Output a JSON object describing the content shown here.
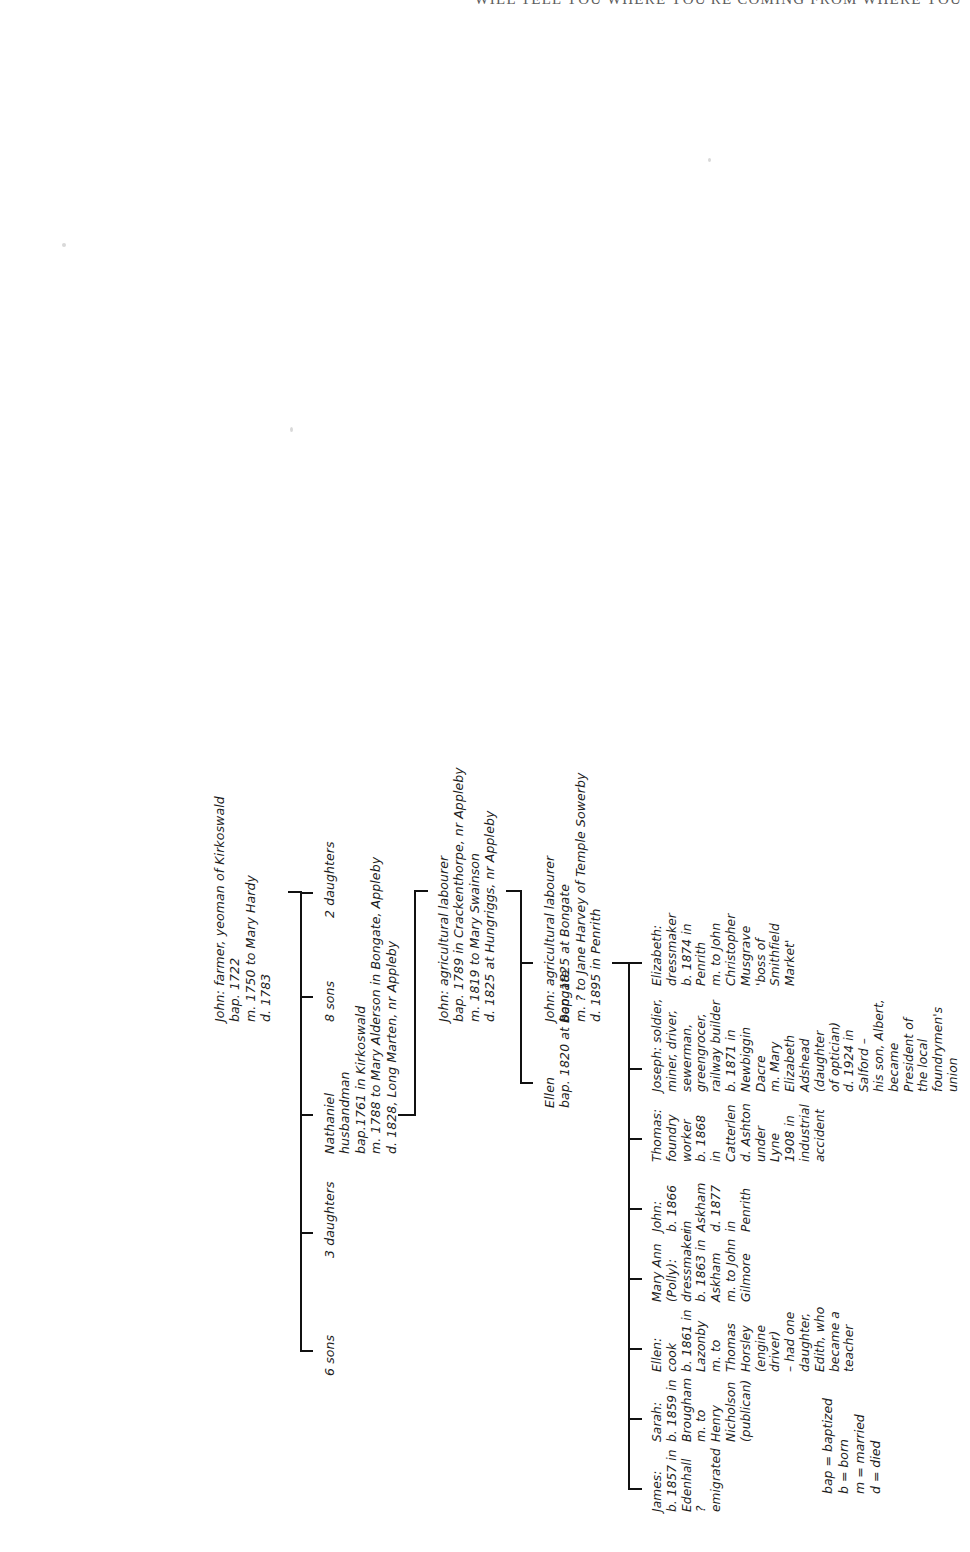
{
  "running_head": "WILL TELL YOU WHERE YOU'RE COMING FROM WHERE YOU",
  "legend": {
    "name": "key-legend",
    "text": "bap = baptized\nb = born\nm = married\nd = died"
  },
  "generations": [
    {
      "id": "gen1",
      "label": "generation-1",
      "nodes": [
        {
          "name": "john-farmer-yeoman",
          "text": "John: farmer, yeoman of Kirkoswald\nbap. 1722\nm. 1750 to Mary Hardy\nd. 1783"
        }
      ]
    },
    {
      "id": "gen2",
      "label": "generation-2",
      "nodes": [
        {
          "name": "six-sons",
          "text": "6 sons"
        },
        {
          "name": "three-daughters",
          "text": "3 daughters"
        },
        {
          "name": "nathaniel",
          "text": "Nathaniel\nhusbandman\nbap.1761 in Kirkoswald\nm. 1788 to Mary Alderson in Bongate, Appleby\nd. 1828, Long Marten, nr Appleby"
        },
        {
          "name": "eight-sons",
          "text": "8 sons"
        },
        {
          "name": "two-daughters",
          "text": "2 daughters"
        }
      ]
    },
    {
      "id": "gen3",
      "label": "generation-3",
      "nodes": [
        {
          "name": "john-ag-labourer-crackenthorpe",
          "text": "John: agricultural labourer\nbap. 1789 in Crackenthorpe, nr Appleby\nm. 1819 to Mary Swainson\nd. 1825 at Hungriggs, nr Appleby"
        }
      ]
    },
    {
      "id": "gen4",
      "label": "generation-4",
      "nodes": [
        {
          "name": "ellen-bongate",
          "text": "Ellen\nbap. 1820 at Bongate"
        },
        {
          "name": "john-ag-labourer-bongate",
          "text": "John: agricultural labourer\nbap. 1825 at Bongate\nm. ? to Jane Harvey of Temple Sowerby\nd. 1895 in Penrith"
        }
      ]
    },
    {
      "id": "gen5",
      "label": "generation-5-children",
      "nodes": [
        {
          "name": "child-james",
          "text": "James:\nb. 1857 in\nEdenhall\n? emigrated"
        },
        {
          "name": "child-sarah",
          "text": "Sarah:\nb. 1859 in\nBrougham\nm. to Henry\nNicholson\n(publican)"
        },
        {
          "name": "child-ellen",
          "text": "Ellen: cook\nb. 1861 in\nLazonby\nm. to Thomas\nHorsley\n(engine driver)\n– had one\ndaughter,\nEdith, who\nbecame a\nteacher"
        },
        {
          "name": "child-mary-ann",
          "text": "Mary Ann\n(Polly):\ndressmaker\nb. 1863 in\nAskham\nm. to John\nGilmore"
        },
        {
          "name": "child-john",
          "text": "John:\nb. 1866 in\nAskham\nd. 1877 in\nPenrith"
        },
        {
          "name": "child-thomas",
          "text": "Thomas:\nfoundry\nworker\nb. 1868 in\nCatterlen\nd. Ashton\nunder Lyne\n1908 in\nindustrial\naccident"
        },
        {
          "name": "child-joseph",
          "text": "Joseph: soldier,\nminer, driver,\nsewerman,\ngreengrocer,\nrailway builder\nb. 1871 in Newbiggin\nDacre\nm. Mary Elizabeth\nAdshead (daughter\nof optician)\nd. 1924 in Salford –\nhis son, Albert,\nbecame President of\nthe local\nfoundrymen's union"
        },
        {
          "name": "child-elizabeth",
          "text": "Elizabeth:\ndressmaker\nb. 1874 in Penrith\nm. to John\nChristopher\nMusgrave\n'boss of Smithfield\nMarket'"
        }
      ]
    }
  ],
  "colors": {
    "ink": "#1d1d1d",
    "rule": "#111111",
    "paper": "#ffffff",
    "running_head": "#5d5d5d"
  }
}
